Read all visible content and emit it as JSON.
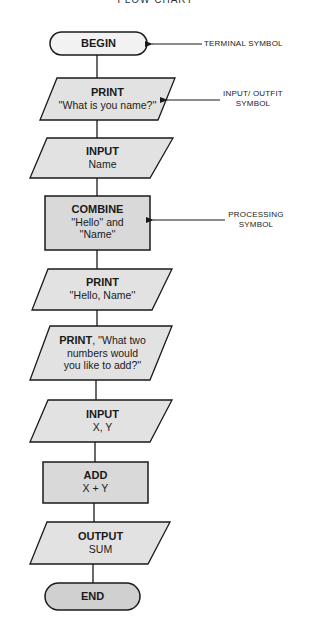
{
  "title": "FLOW CHART",
  "colors": {
    "stroke": "#1a1a1a",
    "io_fill": "#e2e2e2",
    "process_fill": "#d9d9d9",
    "begin_fill": "#f2f2f2",
    "end_fill": "#d0d0d0"
  },
  "nodes": [
    {
      "id": "begin",
      "type": "terminal",
      "line1": "BEGIN",
      "line2": ""
    },
    {
      "id": "print-name-prompt",
      "type": "input-output",
      "line1": "PRINT",
      "line2": "''What is you name?''"
    },
    {
      "id": "input-name",
      "type": "input-output",
      "line1": "INPUT",
      "line2": "Name"
    },
    {
      "id": "combine",
      "type": "process",
      "line1": "COMBINE",
      "line2": "''Hello'' and",
      "line3": "''Name''"
    },
    {
      "id": "print-hello",
      "type": "input-output",
      "line1": "PRINT",
      "line2": "''Hello, Name''"
    },
    {
      "id": "print-numbers-prompt",
      "type": "input-output",
      "line1": "PRINT",
      "line1_suffix": ", ''What two",
      "line2": "numbers would",
      "line3": "you like to add?''"
    },
    {
      "id": "input-xy",
      "type": "input-output",
      "line1": "INPUT",
      "line2": "X, Y"
    },
    {
      "id": "add",
      "type": "process",
      "line1": "ADD",
      "line2": "X + Y"
    },
    {
      "id": "output-sum",
      "type": "input-output",
      "line1": "OUTPUT",
      "line2": "SUM"
    },
    {
      "id": "end",
      "type": "terminal",
      "line1": "END",
      "line2": ""
    }
  ],
  "annotations": [
    {
      "target": "begin",
      "line1": "TERMINAL SYMBOL",
      "line2": ""
    },
    {
      "target": "print-name-prompt",
      "line1": "INPUT/ OUTFIT",
      "line2": "SYMBOL"
    },
    {
      "target": "combine",
      "line1": "PROCESSING",
      "line2": "SYMBOL"
    }
  ]
}
